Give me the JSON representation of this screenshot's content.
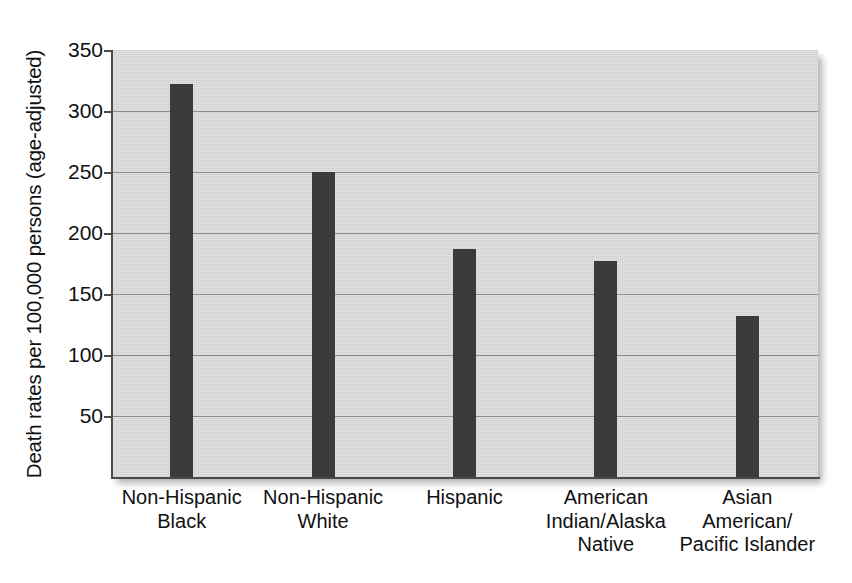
{
  "chart_data": {
    "type": "bar",
    "title": "",
    "subtitle": "",
    "xlabel": "",
    "ylabel": "Death rates per 100,000 persons (age-adjusted)",
    "categories": [
      "Non-Hispanic Black",
      "Non-Hispanic White",
      "Hispanic",
      "American Indian/Alaska Native",
      "Asian American/Pacific Islander"
    ],
    "category_lines": [
      [
        "Non-Hispanic",
        "Black"
      ],
      [
        "Non-Hispanic",
        "White"
      ],
      [
        "Hispanic"
      ],
      [
        "American",
        "Indian/Alaska",
        "Native"
      ],
      [
        "Asian",
        "American/",
        "Pacific Islander"
      ]
    ],
    "values": [
      322,
      250,
      187,
      177,
      132
    ],
    "ylim": [
      0,
      350
    ],
    "yticks": [
      50,
      100,
      150,
      200,
      250,
      300,
      350
    ],
    "ytick_labels": [
      "50",
      "100",
      "150",
      "200",
      "250",
      "300",
      "350"
    ],
    "grid": true,
    "legend": "none",
    "bar_color": "#3b3b3b",
    "plot_background": "#dcdcdc",
    "gridline_color": "#8d8d8d",
    "axis_color": "#4a4a4a",
    "page_background": "#ffffff"
  }
}
